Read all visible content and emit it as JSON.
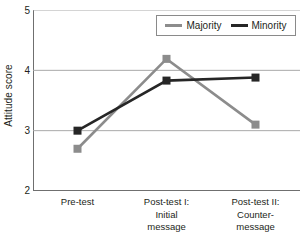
{
  "chart_data": {
    "type": "line",
    "title": "",
    "xlabel": "",
    "ylabel": "Attitude score",
    "ylim": [
      2,
      5
    ],
    "yticks": [
      2,
      3,
      4,
      5
    ],
    "ytick_labels": [
      "2",
      "3",
      "4",
      "5"
    ],
    "grid": true,
    "grid_axis": "y",
    "legend_position": "top-right",
    "categories": [
      "Pre-test",
      "Post-test I:\nInitial\nmessage",
      "Post-test II:\nCounter-\nmessage"
    ],
    "category_labels_flat": [
      "Pre-test",
      "Post-test I: Initial message",
      "Post-test II: Counter-message"
    ],
    "series": [
      {
        "name": "Majority",
        "color": "#8c8c8c",
        "marker": "square",
        "values": [
          2.7,
          4.19,
          3.1
        ]
      },
      {
        "name": "Minority",
        "color": "#262626",
        "marker": "square",
        "values": [
          3.0,
          3.83,
          3.88
        ]
      }
    ]
  },
  "axis": {
    "y_title": "Attitude score",
    "y_ticks": [
      "5",
      "4",
      "3",
      "2"
    ],
    "x_labels": [
      "Pre-test",
      "Post-test I:\nInitial\nmessage",
      "Post-test II:\nCounter-\nmessage"
    ]
  },
  "legend": {
    "items": [
      {
        "label": "Majority",
        "color": "#8c8c8c"
      },
      {
        "label": "Minority",
        "color": "#262626"
      }
    ]
  },
  "colors": {
    "majority": "#8c8c8c",
    "minority": "#262626",
    "axis": "#6f6f6f",
    "grid": "#a9a9a9",
    "text": "#231f20",
    "background": "#ffffff"
  }
}
